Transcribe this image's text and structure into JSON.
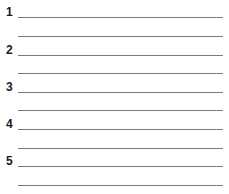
{
  "worksheet": {
    "items": [
      {
        "number": "1"
      },
      {
        "number": "2"
      },
      {
        "number": "3"
      },
      {
        "number": "4"
      },
      {
        "number": "5"
      }
    ],
    "line_color": "#7a7a7a"
  }
}
